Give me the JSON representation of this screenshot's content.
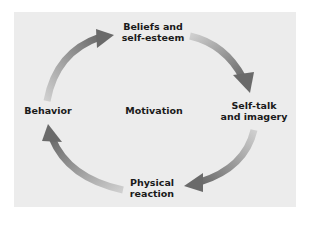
{
  "diagram": {
    "type": "cycle",
    "center_label": "Motivation",
    "nodes": [
      {
        "id": "beliefs",
        "line1": "Beliefs and",
        "line2": "self-esteem"
      },
      {
        "id": "selftalk",
        "line1": "Self-talk",
        "line2": "and imagery"
      },
      {
        "id": "physical",
        "line1": "Physical",
        "line2": "reaction"
      },
      {
        "id": "behavior",
        "line1": "Behavior"
      }
    ],
    "edges": [
      {
        "from": "beliefs",
        "to": "selftalk"
      },
      {
        "from": "selftalk",
        "to": "physical"
      },
      {
        "from": "physical",
        "to": "behavior"
      },
      {
        "from": "behavior",
        "to": "beliefs"
      }
    ],
    "colors": {
      "panel": "#ececec",
      "arrow_dark": "#6e6e6e",
      "arrow_light": "#c8c8c8",
      "text": "#1a1a1a"
    }
  }
}
